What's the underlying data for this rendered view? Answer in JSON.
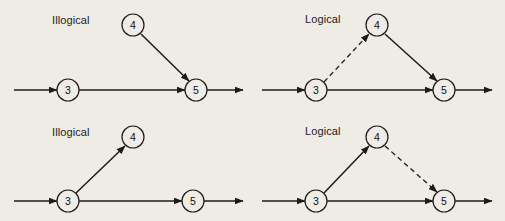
{
  "figure": {
    "background_color": "#efece6",
    "ink_color": "#1b1b1b",
    "width": 505,
    "height": 221
  },
  "panels": [
    {
      "id": "top-left",
      "label": "Illogical",
      "label_x": 52,
      "label_y": 14,
      "nodes": [
        {
          "id": "n3",
          "label": "3",
          "cx": 68,
          "cy": 90,
          "r": 11
        },
        {
          "id": "n4",
          "label": "4",
          "cx": 133,
          "cy": 25,
          "r": 11
        },
        {
          "id": "n5",
          "label": "5",
          "cx": 196,
          "cy": 90,
          "r": 11
        }
      ],
      "edges": [
        {
          "id": "in-3",
          "from_x": 14,
          "from_y": 90,
          "to_x": 57,
          "to_y": 90,
          "style": "solid",
          "arrow": true
        },
        {
          "id": "e3-5",
          "from_x": 79,
          "from_y": 90,
          "to_x": 185,
          "to_y": 90,
          "style": "solid",
          "arrow": true
        },
        {
          "id": "e4-5",
          "from_x": 141,
          "from_y": 34,
          "to_x": 189,
          "to_y": 81,
          "style": "solid",
          "arrow": true
        },
        {
          "id": "out-5",
          "from_x": 207,
          "from_y": 90,
          "to_x": 243,
          "to_y": 90,
          "style": "solid",
          "arrow": true
        }
      ]
    },
    {
      "id": "top-right",
      "label": "Logical",
      "label_x": 305,
      "label_y": 13,
      "nodes": [
        {
          "id": "n3",
          "label": "3",
          "cx": 316,
          "cy": 90,
          "r": 11
        },
        {
          "id": "n4",
          "label": "4",
          "cx": 377,
          "cy": 25,
          "r": 11
        },
        {
          "id": "n5",
          "label": "5",
          "cx": 444,
          "cy": 90,
          "r": 11
        }
      ],
      "edges": [
        {
          "id": "in-3",
          "from_x": 262,
          "from_y": 90,
          "to_x": 305,
          "to_y": 90,
          "style": "solid",
          "arrow": true
        },
        {
          "id": "e3-4",
          "from_x": 324,
          "from_y": 82,
          "to_x": 369,
          "to_y": 34,
          "style": "dashed",
          "arrow": true
        },
        {
          "id": "e3-5",
          "from_x": 327,
          "from_y": 90,
          "to_x": 433,
          "to_y": 90,
          "style": "solid",
          "arrow": true
        },
        {
          "id": "e4-5",
          "from_x": 385,
          "from_y": 34,
          "to_x": 437,
          "to_y": 81,
          "style": "solid",
          "arrow": true
        },
        {
          "id": "out-5",
          "from_x": 455,
          "from_y": 90,
          "to_x": 492,
          "to_y": 90,
          "style": "solid",
          "arrow": true
        }
      ]
    },
    {
      "id": "bottom-left",
      "label": "Illogical",
      "label_x": 52,
      "label_y": 126,
      "nodes": [
        {
          "id": "n3",
          "label": "3",
          "cx": 68,
          "cy": 201,
          "r": 11
        },
        {
          "id": "n4",
          "label": "4",
          "cx": 133,
          "cy": 137,
          "r": 11
        },
        {
          "id": "n5",
          "label": "5",
          "cx": 193,
          "cy": 201,
          "r": 11
        }
      ],
      "edges": [
        {
          "id": "in-3",
          "from_x": 14,
          "from_y": 201,
          "to_x": 57,
          "to_y": 201,
          "style": "solid",
          "arrow": true
        },
        {
          "id": "e3-4",
          "from_x": 76,
          "from_y": 193,
          "to_x": 125,
          "to_y": 146,
          "style": "solid",
          "arrow": true
        },
        {
          "id": "e3-5",
          "from_x": 79,
          "from_y": 201,
          "to_x": 182,
          "to_y": 201,
          "style": "solid",
          "arrow": true
        },
        {
          "id": "out-5",
          "from_x": 204,
          "from_y": 201,
          "to_x": 243,
          "to_y": 201,
          "style": "solid",
          "arrow": true
        }
      ]
    },
    {
      "id": "bottom-right",
      "label": "Logical",
      "label_x": 305,
      "label_y": 125,
      "nodes": [
        {
          "id": "n3",
          "label": "3",
          "cx": 316,
          "cy": 201,
          "r": 11
        },
        {
          "id": "n4",
          "label": "4",
          "cx": 377,
          "cy": 137,
          "r": 11
        },
        {
          "id": "n5",
          "label": "5",
          "cx": 444,
          "cy": 201,
          "r": 11
        }
      ],
      "edges": [
        {
          "id": "in-3",
          "from_x": 262,
          "from_y": 201,
          "to_x": 305,
          "to_y": 201,
          "style": "solid",
          "arrow": true
        },
        {
          "id": "e3-4",
          "from_x": 324,
          "from_y": 193,
          "to_x": 369,
          "to_y": 146,
          "style": "solid",
          "arrow": true
        },
        {
          "id": "e3-5",
          "from_x": 327,
          "from_y": 201,
          "to_x": 433,
          "to_y": 201,
          "style": "solid",
          "arrow": true
        },
        {
          "id": "e4-5",
          "from_x": 385,
          "from_y": 146,
          "to_x": 437,
          "to_y": 192,
          "style": "dashed",
          "arrow": true
        },
        {
          "id": "out-5",
          "from_x": 455,
          "from_y": 201,
          "to_x": 492,
          "to_y": 201,
          "style": "solid",
          "arrow": true
        }
      ]
    }
  ]
}
